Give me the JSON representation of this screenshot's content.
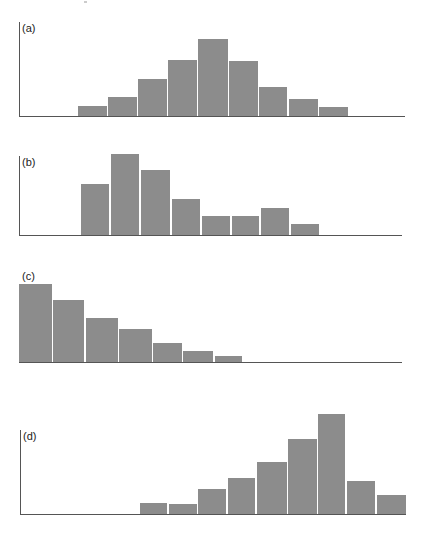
{
  "colors": {
    "bar": "#8c8c8c",
    "axis": "#555555",
    "background": "#ffffff"
  },
  "chart_data": [
    {
      "type": "bar",
      "title": "(a)",
      "description": "Symmetric (normal-like) distribution",
      "values": [
        10,
        19,
        37,
        56,
        77,
        55,
        29,
        17,
        9
      ],
      "layout": {
        "baseline_y": 116,
        "axis_left": 19,
        "axis_right": 405,
        "axis_top": 22,
        "has_y_axis": true,
        "bars_x": [
          [
            78,
            107
          ],
          [
            108,
            137
          ],
          [
            138,
            167
          ],
          [
            168,
            197
          ],
          [
            198,
            228
          ],
          [
            229,
            258
          ],
          [
            259,
            287
          ],
          [
            289,
            318
          ],
          [
            319,
            348
          ]
        ]
      }
    },
    {
      "type": "bar",
      "title": "(b)",
      "description": "Positively skewed distribution",
      "values": [
        51,
        81,
        65,
        36,
        19,
        19,
        27,
        11
      ],
      "layout": {
        "baseline_y": 235,
        "axis_left": 19,
        "axis_right": 402,
        "axis_top": 156,
        "has_y_axis": true,
        "bars_x": [
          [
            81,
            109
          ],
          [
            111,
            139
          ],
          [
            141,
            170
          ],
          [
            172,
            200
          ],
          [
            202,
            230
          ],
          [
            232,
            259
          ],
          [
            261,
            289
          ],
          [
            291,
            319
          ]
        ]
      }
    },
    {
      "type": "bar",
      "title": "(c)",
      "description": "Strongly positively skewed (J-shaped) distribution",
      "values": [
        78,
        62,
        44,
        33,
        19,
        11,
        6
      ],
      "layout": {
        "baseline_y": 362,
        "axis_left": 19,
        "axis_right": 402,
        "axis_top": 284,
        "has_y_axis": false,
        "bars_x": [
          [
            19,
            52
          ],
          [
            53,
            84
          ],
          [
            86,
            118
          ],
          [
            119,
            152
          ],
          [
            153,
            182
          ],
          [
            183,
            213
          ],
          [
            215,
            242
          ]
        ]
      }
    },
    {
      "type": "bar",
      "title": "(d)",
      "description": "Negatively skewed distribution",
      "values": [
        11,
        10,
        25,
        36,
        52,
        75,
        100,
        33,
        19
      ],
      "layout": {
        "baseline_y": 514,
        "axis_left": 20,
        "axis_right": 406,
        "axis_top": 430,
        "has_y_axis": true,
        "bars_x": [
          [
            140,
            167
          ],
          [
            169,
            197
          ],
          [
            198,
            226
          ],
          [
            228,
            255
          ],
          [
            257,
            287
          ],
          [
            288,
            317
          ],
          [
            318,
            345
          ],
          [
            347,
            375
          ],
          [
            377,
            406
          ]
        ]
      }
    }
  ]
}
